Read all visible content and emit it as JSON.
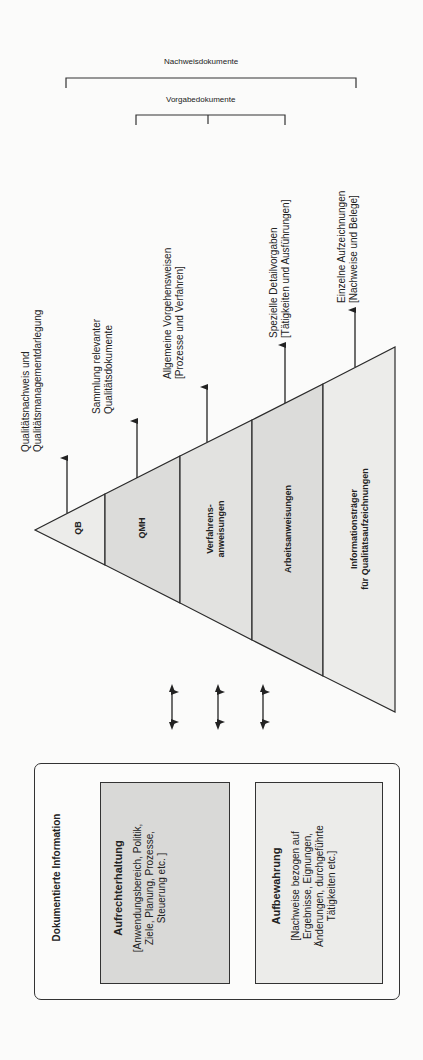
{
  "brackets": {
    "outer_label": "Nachweisdokumente",
    "inner_label": "Vorgabedokumente"
  },
  "pyramid": {
    "levels": [
      {
        "label": "QB",
        "fill": "#ececea"
      },
      {
        "label": "QMH",
        "fill": "#dcdcda"
      },
      {
        "label_line1": "Verfahrens-",
        "label_line2": "anweisungen",
        "fill": "#e2e2e0"
      },
      {
        "label": "Arbeitsanweisungen",
        "fill": "#dcdcda"
      },
      {
        "label_line1": "Informationsträger",
        "label_line2": "für Qualitätsaufzeichnungen",
        "fill": "#ececea"
      }
    ],
    "descriptions": [
      {
        "line1": "Qualitätsnachweis und",
        "line2": "Qualitätsmanagementdarlegung"
      },
      {
        "line1": "Sammlung relevanter",
        "line2": "Qualitätsdokumente"
      },
      {
        "line1": "Allgemeine Vorgehensweisen",
        "line2": "[Prozesse und Verfahren]"
      },
      {
        "line1": "Spezielle Detailvorgaben",
        "line2": "[Tätigkeiten und Ausführungen]"
      },
      {
        "line1": "Einzelne Aufzeichnungen",
        "line2": "[Nachweise und Belege]"
      }
    ]
  },
  "documented_information": {
    "title": "Dokumentierte Information",
    "maintain": {
      "title": "Aufrechterhaltung",
      "line1": "[Anwendungsbereich, Politik,",
      "line2": "Ziele, Planung, Prozesse,",
      "line3": "Steuerung etc. ]"
    },
    "retain": {
      "title": "Aufbewahrung",
      "line1": "[Nachweise bezogen auf",
      "line2": "Ergebnisse, Eignungen,",
      "line3": "Änderungen, durchgeführte",
      "line4": "Tätigkeiten etc.]"
    }
  },
  "colors": {
    "line": "#2a2a2a",
    "dark_fill": "#d9d9d7",
    "light_fill": "#ececea"
  }
}
